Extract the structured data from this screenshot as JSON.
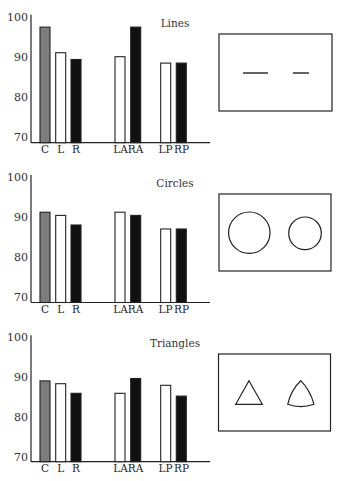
{
  "chart_data": [
    {
      "type": "bar",
      "title": "Lines",
      "categories": [
        "C",
        "L",
        "R",
        "LA",
        "RA",
        "LP",
        "RP"
      ],
      "values": [
        97.4,
        91.0,
        89.3,
        90.0,
        97.4,
        88.4,
        88.4
      ],
      "bar_styles": [
        "gray",
        "white",
        "black",
        "white",
        "black",
        "white",
        "black"
      ],
      "ylim": [
        69,
        100
      ],
      "yticks": [
        70,
        80,
        90,
        100
      ],
      "xlabel": "",
      "ylabel": "",
      "grid": false,
      "stimulus": {
        "shape": "lines",
        "left": "long horizontal line",
        "right": "short horizontal line"
      }
    },
    {
      "type": "bar",
      "title": "Circles",
      "categories": [
        "C",
        "L",
        "R",
        "LA",
        "RA",
        "LP",
        "RP"
      ],
      "values": [
        91.2,
        90.4,
        88.0,
        91.2,
        90.4,
        87.0,
        87.0
      ],
      "bar_styles": [
        "gray",
        "white",
        "black",
        "white",
        "black",
        "white",
        "black"
      ],
      "ylim": [
        69,
        100
      ],
      "yticks": [
        70,
        80,
        90,
        100
      ],
      "xlabel": "",
      "ylabel": "",
      "grid": false,
      "stimulus": {
        "shape": "circles",
        "left": "large circle",
        "right": "small circle"
      }
    },
    {
      "type": "bar",
      "title": "Triangles",
      "categories": [
        "C",
        "L",
        "R",
        "LA",
        "RA",
        "LP",
        "RP"
      ],
      "values": [
        89.1,
        88.4,
        86.0,
        86.0,
        89.7,
        88.0,
        85.3
      ],
      "bar_styles": [
        "gray",
        "white",
        "black",
        "white",
        "black",
        "white",
        "black"
      ],
      "ylim": [
        69,
        100
      ],
      "yticks": [
        70,
        80,
        90,
        100
      ],
      "xlabel": "",
      "ylabel": "",
      "grid": false,
      "stimulus": {
        "shape": "triangles",
        "left": "straight-sided triangle",
        "right": "curved-sided triangle"
      }
    }
  ],
  "colors": {
    "gray": "#7d7d7d",
    "white": "#ffffff",
    "black": "#111111",
    "stroke": "#222222"
  }
}
